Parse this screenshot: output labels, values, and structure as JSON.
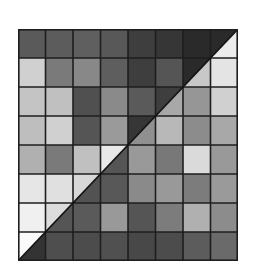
{
  "diagram": {
    "title": "",
    "rows": 8,
    "cols": 8,
    "grid_line_color": "#1e1e1e",
    "diagonal": {
      "from": "bottom-left",
      "to": "top-right",
      "color": "#141414"
    },
    "cells": [
      [
        "#5a5a5a",
        "#5c5c5c",
        "#5f5f5f",
        "#585858",
        "#3e3e3e",
        "#363636",
        "#2a2a2a",
        {
          "upper": "#2a2a2a",
          "lower": "#ececec"
        }
      ],
      [
        "#d0d0d0",
        "#7a7a7a",
        "#888888",
        "#5e5e5e",
        "#3e3e3e",
        "#555555",
        {
          "upper": "#2a2a2a",
          "lower": "#c8c8c8"
        },
        "#e4e4e4"
      ],
      [
        "#c4c4c4",
        "#c0c0c0",
        "#505050",
        "#8a8a8a",
        "#5a5a5a",
        {
          "upper": "#3e3e3e",
          "lower": "#a8a8a8"
        },
        "#969696",
        "#d0d0d0"
      ],
      [
        "#bebebe",
        "#d0d0d0",
        "#555555",
        "#9a9a9a",
        {
          "upper": "#363636",
          "lower": "#909090"
        },
        "#b8b8b8",
        "#8c8c8c",
        "#a8a8a8"
      ],
      [
        "#b0b0b0",
        "#7a7a7a",
        "#c0c0c0",
        {
          "upper": "#e8e8e8",
          "lower": "#555555"
        },
        "#999999",
        "#787878",
        "#dadada",
        "#999999"
      ],
      [
        "#e6e6e6",
        "#e0e0e0",
        {
          "upper": "#d8d8d8",
          "lower": "#525252"
        },
        "#585858",
        "#8a8a8a",
        "#999999",
        "#7c7c7c",
        "#9a9a9a"
      ],
      [
        "#f0f0f0",
        {
          "upper": "#dcdcdc",
          "lower": "#555555"
        },
        "#5a5a5a",
        "#999999",
        "#555555",
        "#7c7c7c",
        "#b0b0b0",
        "#8c8c8c"
      ],
      [
        {
          "upper": "#fafafa",
          "lower": "#333333"
        },
        "#4e4e4e",
        "#4c4c4c",
        "#505050",
        "#484848",
        "#4c4c4c",
        "#5c5c5c",
        "#6a6a6a"
      ]
    ]
  }
}
